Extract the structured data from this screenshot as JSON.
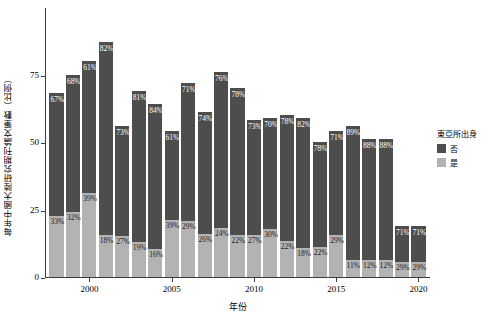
{
  "chart_data": {
    "type": "bar",
    "subtype": "stacked-percentage",
    "title": "",
    "xlabel": "年份",
    "ylabel": "每年中國大陸研究期刊論文筆數（比例）",
    "ylim": [
      0,
      100
    ],
    "yticks": [
      0,
      25,
      50,
      75
    ],
    "ytick_labels": [
      "0",
      "25",
      "50",
      "75"
    ],
    "xticks": [
      2000,
      2005,
      2010,
      2015,
      2020
    ],
    "xtick_labels": [
      "2000",
      "2005",
      "2010",
      "2015",
      "2020"
    ],
    "xlim": [
      1997.3,
      2020.7
    ],
    "grid": false,
    "legend": {
      "title": "東亞所出身",
      "position": "right",
      "entries": [
        {
          "label": "否",
          "color": "#4d4d4d"
        },
        {
          "label": "是",
          "color": "#b3b3b3"
        }
      ]
    },
    "categories": [
      1998,
      1999,
      2000,
      2001,
      2002,
      2003,
      2004,
      2005,
      2006,
      2007,
      2008,
      2009,
      2010,
      2011,
      2012,
      2013,
      2014,
      2015,
      2016,
      2017,
      2018,
      2019,
      2020
    ],
    "series": [
      {
        "name": "否",
        "color": "#4d4d4d",
        "values": [
          67,
          68,
          61,
          82,
          73,
          81,
          84,
          61,
          71,
          74,
          76,
          78,
          73,
          70,
          78,
          82,
          78,
          71,
          89,
          88,
          88,
          71,
          71
        ],
        "labels": [
          "67%",
          "68%",
          "61%",
          "82%",
          "73%",
          "81%",
          "84%",
          "61%",
          "71%",
          "74%",
          "76%",
          "78%",
          "73%",
          "70%",
          "78%",
          "82%",
          "78%",
          "71%",
          "89%",
          "88%",
          "88%",
          "71%",
          "71%"
        ]
      },
      {
        "name": "是",
        "color": "#b3b3b3",
        "values": [
          33,
          32,
          39,
          18,
          27,
          19,
          16,
          39,
          29,
          26,
          24,
          22,
          27,
          30,
          22,
          18,
          22,
          29,
          11,
          12,
          12,
          29,
          29
        ],
        "labels": [
          "33%",
          "32%",
          "39%",
          "18%",
          "27%",
          "19%",
          "16%",
          "39%",
          "29%",
          "26%",
          "24%",
          "22%",
          "27%",
          "30%",
          "22%",
          "18%",
          "22%",
          "29%",
          "11%",
          "12%",
          "12%",
          "29%",
          "29%"
        ]
      }
    ],
    "bar_totals": [
      68,
      75,
      80,
      87,
      56,
      69,
      64,
      54,
      72,
      61,
      76,
      70,
      58,
      59,
      60,
      59,
      50,
      54,
      56,
      51,
      51,
      19,
      19
    ]
  }
}
